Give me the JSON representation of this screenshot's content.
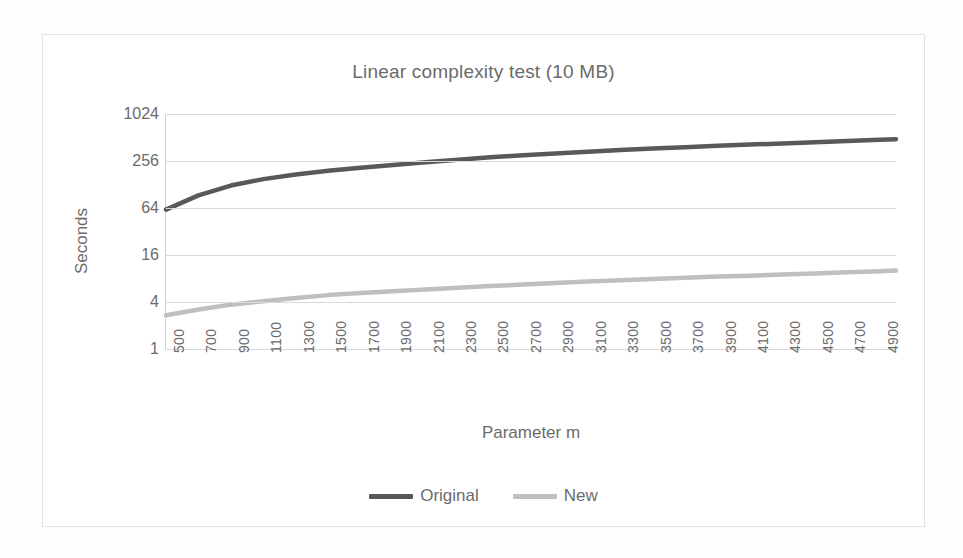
{
  "chart": {
    "title": "Linear complexity test (10 MB)",
    "xlabel": "Parameter m",
    "ylabel": "Seconds",
    "legend": [
      {
        "label": "Original",
        "color": "#595959"
      },
      {
        "label": "New",
        "color": "#bfbfbf"
      }
    ]
  },
  "chart_data": {
    "type": "line",
    "title": "Linear complexity test (10 MB)",
    "xlabel": "Parameter m",
    "ylabel": "Seconds",
    "yscale": "log",
    "ylim": [
      1,
      1024
    ],
    "ytick_labels": [
      "1024",
      "256",
      "64",
      "16",
      "4",
      "1"
    ],
    "yticks": [
      1024,
      256,
      64,
      16,
      4,
      1
    ],
    "xlim": [
      500,
      5000
    ],
    "xtick_labels": [
      "500",
      "700",
      "900",
      "1100",
      "1300",
      "1500",
      "1700",
      "1900",
      "2100",
      "2300",
      "2500",
      "2700",
      "2900",
      "3100",
      "3300",
      "3500",
      "3700",
      "3900",
      "4100",
      "4300",
      "4500",
      "4700",
      "4900"
    ],
    "x": [
      500,
      700,
      900,
      1100,
      1300,
      1500,
      1700,
      1900,
      2100,
      2300,
      2500,
      2700,
      2900,
      3100,
      3300,
      3500,
      3700,
      3900,
      4100,
      4300,
      4500,
      4700,
      4900,
      5000
    ],
    "grid": true,
    "legend_position": "bottom",
    "series": [
      {
        "name": "Original",
        "color": "#595959",
        "values": [
          61,
          93,
          124,
          150,
          172,
          192,
          210,
          228,
          247,
          266,
          285,
          303,
          320,
          337,
          353,
          369,
          385,
          400,
          415,
          430,
          446,
          462,
          478,
          486
        ]
      },
      {
        "name": "New",
        "color": "#bfbfbf",
        "values": [
          2.7,
          3.2,
          3.7,
          4.1,
          4.5,
          4.9,
          5.2,
          5.5,
          5.8,
          6.1,
          6.4,
          6.7,
          7.0,
          7.3,
          7.6,
          7.9,
          8.2,
          8.5,
          8.7,
          9.0,
          9.3,
          9.6,
          9.9,
          10.1
        ]
      }
    ]
  }
}
